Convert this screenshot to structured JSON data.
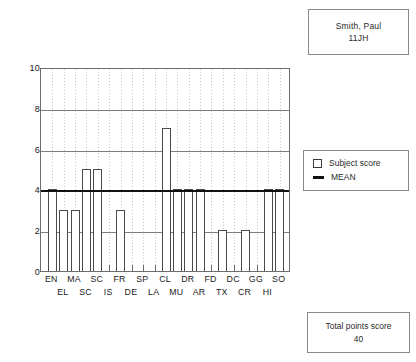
{
  "student_box": {
    "name": "Smith, Paul",
    "form": "11JH"
  },
  "legend": {
    "items": [
      {
        "label": "Subject score",
        "icon": "square-outline-icon"
      },
      {
        "label": "MEAN",
        "icon": "thick-line-icon"
      }
    ]
  },
  "total_box": {
    "label": "Total points score",
    "value": "40"
  },
  "chart_data": {
    "type": "bar",
    "title": "",
    "xlabel": "",
    "ylabel": "",
    "ylim": [
      0,
      10
    ],
    "yticks": [
      0,
      2,
      4,
      6,
      8,
      10
    ],
    "grid": "horizontal-solid-vertical-dotted",
    "legend_position": "right",
    "categories": [
      "EN",
      "EL",
      "MA",
      "SC",
      "SC",
      "IS",
      "FR",
      "DE",
      "SP",
      "LA",
      "CL",
      "MU",
      "DR",
      "AR",
      "FD",
      "TX",
      "DC",
      "CR",
      "GG",
      "HI",
      "SO"
    ],
    "values": [
      4,
      3,
      3,
      5,
      5,
      0,
      3,
      0,
      0,
      0,
      7,
      4,
      4,
      4,
      0,
      2,
      0,
      2,
      0,
      4,
      4
    ],
    "series": [
      {
        "name": "Subject score",
        "values": [
          4,
          3,
          3,
          5,
          5,
          0,
          3,
          0,
          0,
          0,
          7,
          4,
          4,
          4,
          0,
          2,
          0,
          2,
          0,
          4,
          4
        ]
      }
    ],
    "annotations": [
      {
        "name": "MEAN",
        "type": "hline",
        "value": 4
      }
    ],
    "label_rows": [
      [
        "EN",
        "MA",
        "SC",
        "FR",
        "SP",
        "CL",
        "DR",
        "FD",
        "DC",
        "GG",
        "SO"
      ],
      [
        "EL",
        "SC",
        "IS",
        "DE",
        "LA",
        "MU",
        "AR",
        "TX",
        "CR",
        "HI"
      ]
    ],
    "colors": {
      "bar_stroke": "#4a4a4a",
      "bar_fill": "#ffffff",
      "mean_line": "#111111",
      "grid": "#7d7d7d",
      "axis": "#6d6d6d"
    }
  }
}
